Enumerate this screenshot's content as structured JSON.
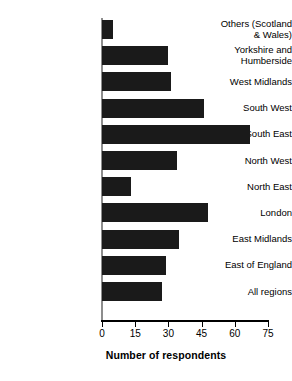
{
  "chart_data": {
    "type": "bar",
    "orientation": "horizontal",
    "title": "",
    "xlabel": "Number of respondents",
    "ylabel": "",
    "xlim": [
      0,
      75
    ],
    "xticks": [
      0,
      15,
      30,
      45,
      60,
      75
    ],
    "xtick_labels": [
      "0",
      "15",
      "30",
      "45",
      "60",
      "75"
    ],
    "grid": false,
    "legend": null,
    "bar_color": "#1a1a1a",
    "background_color": "#ffffff",
    "categories": [
      "Others (Scotland\n& Wales)",
      "Yorkshire and\nHumberside",
      "West Midlands",
      "South West",
      "South East",
      "North West",
      "North East",
      "London",
      "East Midlands",
      "East of England",
      "All regions"
    ],
    "values": [
      5,
      30,
      31,
      46,
      67,
      34,
      13,
      48,
      35,
      29,
      27
    ]
  }
}
